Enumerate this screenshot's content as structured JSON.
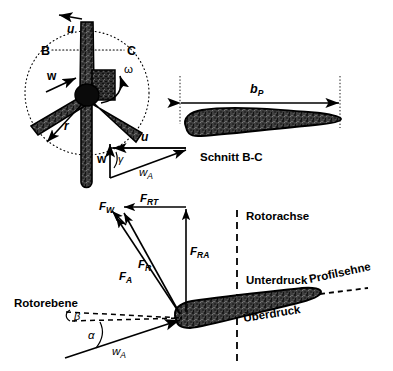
{
  "figure": {
    "background_color": "#ffffff",
    "ink_color": "#000000",
    "blade_fill_color": "#3a3a3a",
    "blade_edge_color": "#000000"
  },
  "top_view": {
    "name": "Rotor front view with three blades",
    "section_marker_left": "B",
    "section_marker_right": "C",
    "circumferential_velocity": "u",
    "wind_velocity": "w",
    "angular_velocity": "ω",
    "radius": "r",
    "blade_count": 3
  },
  "velocity_triangle": {
    "name": "Velocity triangle at blade section",
    "circumferential_velocity": "u",
    "wind_velocity": "w",
    "relative_velocity_symbol": "w",
    "relative_velocity_sub": "A",
    "angle": "γ"
  },
  "section_view": {
    "name": "Airfoil section B-C",
    "caption": "Schnitt B-C",
    "chord_symbol": "b",
    "chord_sub": "P"
  },
  "force_diagram": {
    "name": "Forces acting on blade profile",
    "forces": [
      {
        "id": "drag",
        "symbol": "F",
        "sub": "W",
        "label": "F_W"
      },
      {
        "id": "lift",
        "symbol": "F",
        "sub": "A",
        "label": "F_A"
      },
      {
        "id": "resultant",
        "symbol": "F",
        "sub": "R",
        "label": "F_R"
      },
      {
        "id": "tangential",
        "symbol": "F",
        "sub": "RT",
        "label": "F_RT"
      },
      {
        "id": "axial",
        "symbol": "F",
        "sub": "RA",
        "label": "F_RA"
      }
    ],
    "rotor_axis": "Rotorachse",
    "rotor_plane": "Rotorebene",
    "suction_side": "Unterdruck",
    "pressure_side": "Überdruck",
    "chord_line": "Profilsehne",
    "angle_of_attack": "α",
    "pitch_angle": "β",
    "relative_velocity_symbol": "w",
    "relative_velocity_sub": "A"
  }
}
